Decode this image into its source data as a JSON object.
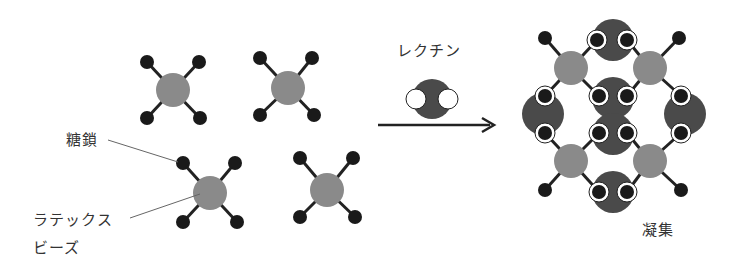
{
  "labels": {
    "sugar_chain": "糖鎖",
    "latex_bead_line1": "ラテックス",
    "latex_bead_line2": "ビーズ",
    "lectin": "レクチン",
    "aggregation": "凝集"
  },
  "colors": {
    "bead": "#8a8a8a",
    "sugar": "#1a1a1a",
    "lectin": "#4a4a4a",
    "binding_site": "#ffffff",
    "line": "#222222",
    "leader": "#666666"
  }
}
